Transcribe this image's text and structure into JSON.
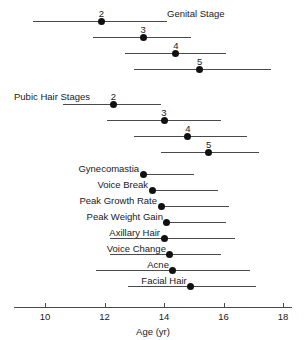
{
  "chart_data": {
    "type": "scatter",
    "title": "",
    "xlabel": "Age (yr)",
    "ylabel": "",
    "xlim": [
      9.0,
      18.4
    ],
    "xticks": [
      10,
      12,
      14,
      16,
      18
    ],
    "xtick_labels": [
      "10",
      "12",
      "14",
      "16",
      "18"
    ],
    "grid": false,
    "legend": "none",
    "orientation": "horizontal",
    "groups": [
      {
        "name": "Genital Stage",
        "label_position": "above-first-row",
        "rows": [
          {
            "label": "2",
            "label_placement": "above-point",
            "mean": 11.9,
            "low": 9.6,
            "high": 14.1
          },
          {
            "label": "3",
            "label_placement": "above-point",
            "mean": 13.3,
            "low": 11.6,
            "high": 14.9
          },
          {
            "label": "4",
            "label_placement": "above-point",
            "mean": 14.4,
            "low": 12.7,
            "high": 16.1
          },
          {
            "label": "5",
            "label_placement": "above-point",
            "mean": 15.2,
            "low": 13.0,
            "high": 17.6
          }
        ]
      },
      {
        "name": "Pubic Hair Stages",
        "label_position": "left-of-first-row",
        "rows": [
          {
            "label": "2",
            "label_placement": "above-point",
            "mean": 12.3,
            "low": 10.6,
            "high": 13.9
          },
          {
            "label": "3",
            "label_placement": "above-point",
            "mean": 14.0,
            "low": 12.1,
            "high": 15.9
          },
          {
            "label": "4",
            "label_placement": "above-point",
            "mean": 14.8,
            "low": 13.0,
            "high": 16.8
          },
          {
            "label": "5",
            "label_placement": "above-point",
            "mean": 15.5,
            "low": 13.9,
            "high": 17.2
          }
        ]
      },
      {
        "name": "",
        "label_position": "none",
        "rows": [
          {
            "label": "Gynecomastia",
            "label_placement": "left-of-point",
            "mean": 13.3,
            "low": 13.3,
            "high": 15.0
          },
          {
            "label": "Voice Break",
            "label_placement": "left-of-point",
            "mean": 13.6,
            "low": 13.6,
            "high": 15.8
          },
          {
            "label": "Peak Growth Rate",
            "label_placement": "left-of-point",
            "mean": 13.9,
            "low": 13.9,
            "high": 16.2
          },
          {
            "label": "Peak Weight Gain",
            "label_placement": "left-of-point",
            "mean": 14.1,
            "low": 14.1,
            "high": 16.1
          },
          {
            "label": "Axillary Hair",
            "label_placement": "left-of-point",
            "mean": 14.0,
            "low": 12.2,
            "high": 16.4
          },
          {
            "label": "Voice Change",
            "label_placement": "left-of-point",
            "mean": 14.2,
            "low": 12.2,
            "high": 15.9
          },
          {
            "label": "Acne",
            "label_placement": "left-of-point",
            "mean": 14.3,
            "low": 11.7,
            "high": 16.9
          },
          {
            "label": "Facial Hair",
            "label_placement": "left-of-point",
            "mean": 14.9,
            "low": 12.8,
            "high": 17.1
          }
        ]
      }
    ]
  },
  "axis": {
    "title": "Age (yr)"
  },
  "colors": {
    "point": "#111111",
    "line": "#4a4a4a",
    "text": "#1a1a1a",
    "background": "#ffffff"
  }
}
